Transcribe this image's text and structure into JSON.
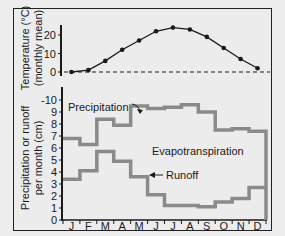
{
  "chart_data": [
    {
      "type": "line",
      "title": "",
      "ylabel": "Temperature (°C) (monthly mean)",
      "ylabel_line1": "Temperature (°C)",
      "ylabel_line2": "(monthly mean)",
      "xlabel": "",
      "categories": [
        "J",
        "F",
        "M",
        "A",
        "M",
        "J",
        "J",
        "A",
        "S",
        "O",
        "N",
        "D"
      ],
      "yticks": [
        0,
        10,
        20
      ],
      "ylim": [
        0,
        25
      ],
      "reference_line": {
        "y": 0,
        "style": "dashed"
      },
      "series": [
        {
          "name": "Temperature",
          "values": [
            0,
            1,
            6,
            12,
            17,
            22,
            24,
            23,
            19,
            13,
            7,
            2
          ],
          "marker": "circle",
          "color": "#1a1a1a"
        }
      ]
    },
    {
      "type": "step",
      "title": "",
      "ylabel": "Precipitation or runoff per month (cm)",
      "ylabel_line1": "Precipitation or runoff",
      "ylabel_line2": "per month (cm)",
      "xlabel": "",
      "categories": [
        "J",
        "F",
        "M",
        "A",
        "M",
        "J",
        "J",
        "A",
        "S",
        "O",
        "N",
        "D"
      ],
      "yticks": [
        0,
        1,
        2,
        3,
        4,
        5,
        6,
        7,
        8,
        9,
        10
      ],
      "ytick_labels": [
        "0",
        "1",
        "2",
        "3",
        "4",
        "5",
        "6",
        "7",
        "8",
        "9",
        "-10"
      ],
      "ylim": [
        0,
        10.5
      ],
      "series": [
        {
          "name": "Precipitation",
          "values": [
            6.8,
            6.3,
            8.4,
            7.9,
            9.5,
            9.3,
            9.4,
            9.6,
            9.0,
            7.5,
            7.6,
            7.4
          ],
          "color": "#8a8a8a"
        },
        {
          "name": "Runoff",
          "values": [
            3.4,
            4.1,
            5.7,
            4.9,
            3.6,
            2.1,
            1.2,
            1.2,
            1.1,
            1.5,
            1.8,
            2.7
          ],
          "color": "#8a8a8a"
        }
      ],
      "annotations": [
        {
          "text": "Precipitation",
          "arrow_to_month": "M"
        },
        {
          "text": "Runoff",
          "arrow_to_month": "J"
        },
        {
          "text": "Evapotranspiration",
          "region": "between precipitation and runoff"
        }
      ]
    }
  ],
  "labels": {
    "temp_axis_1": "Temperature (°C)",
    "temp_axis_2": "(monthly mean)",
    "precip_axis_1": "Precipitation or runoff",
    "precip_axis_2": "per month (cm)",
    "precipitation": "Precipitation",
    "runoff": "Runoff",
    "evapotranspiration": "Evapotranspiration"
  }
}
